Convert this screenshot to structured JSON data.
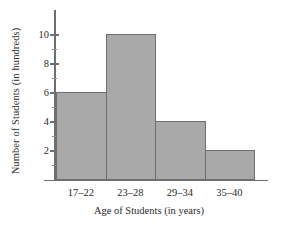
{
  "chart_data": {
    "type": "bar",
    "title": "",
    "subtitle": "",
    "xlabel": "Age of Students (in years)",
    "ylabel": "Number of Students (in hundreds)",
    "categories": [
      "17–22",
      "23–28",
      "29–34",
      "35–40"
    ],
    "values": [
      6,
      10,
      4,
      2
    ],
    "series": [
      {
        "name": "Number of Students (in hundreds)",
        "values": [
          6,
          10,
          4,
          2
        ]
      }
    ],
    "ylim": [
      0,
      11
    ],
    "y_major_ticks": [
      2,
      4,
      6,
      8,
      10
    ],
    "y_minor_ticks": [
      1,
      3,
      5,
      7,
      9,
      11
    ],
    "y_tick_labels": [
      "2",
      "4",
      "6",
      "8",
      "10"
    ],
    "grid": false,
    "legend": false,
    "legend_position": "none",
    "bar_style": "histogram-contiguous",
    "colors": {
      "bar_fill": "#a9a9a9",
      "bar_border": "#6e6e6e",
      "axis": "#6e6e6e",
      "text": "#2b2b2b",
      "background": "#ffffff"
    }
  },
  "axes": {
    "y": {
      "label": "Number of Students (in hundreds)",
      "ticks": [
        {
          "value": 10,
          "label": "10",
          "major": true
        },
        {
          "value": 9,
          "label": "",
          "major": false
        },
        {
          "value": 8,
          "label": "8",
          "major": true
        },
        {
          "value": 7,
          "label": "",
          "major": false
        },
        {
          "value": 6,
          "label": "6",
          "major": true
        },
        {
          "value": 5,
          "label": "",
          "major": false
        },
        {
          "value": 4,
          "label": "4",
          "major": true
        },
        {
          "value": 3,
          "label": "",
          "major": false
        },
        {
          "value": 2,
          "label": "2",
          "major": true
        },
        {
          "value": 1,
          "label": "",
          "major": false
        }
      ]
    },
    "x": {
      "label": "Age of Students (in years)",
      "categories": [
        {
          "label": "17–22",
          "value": 6
        },
        {
          "label": "23–28",
          "value": 10
        },
        {
          "label": "29–34",
          "value": 4
        },
        {
          "label": "35–40",
          "value": 2
        }
      ]
    }
  }
}
